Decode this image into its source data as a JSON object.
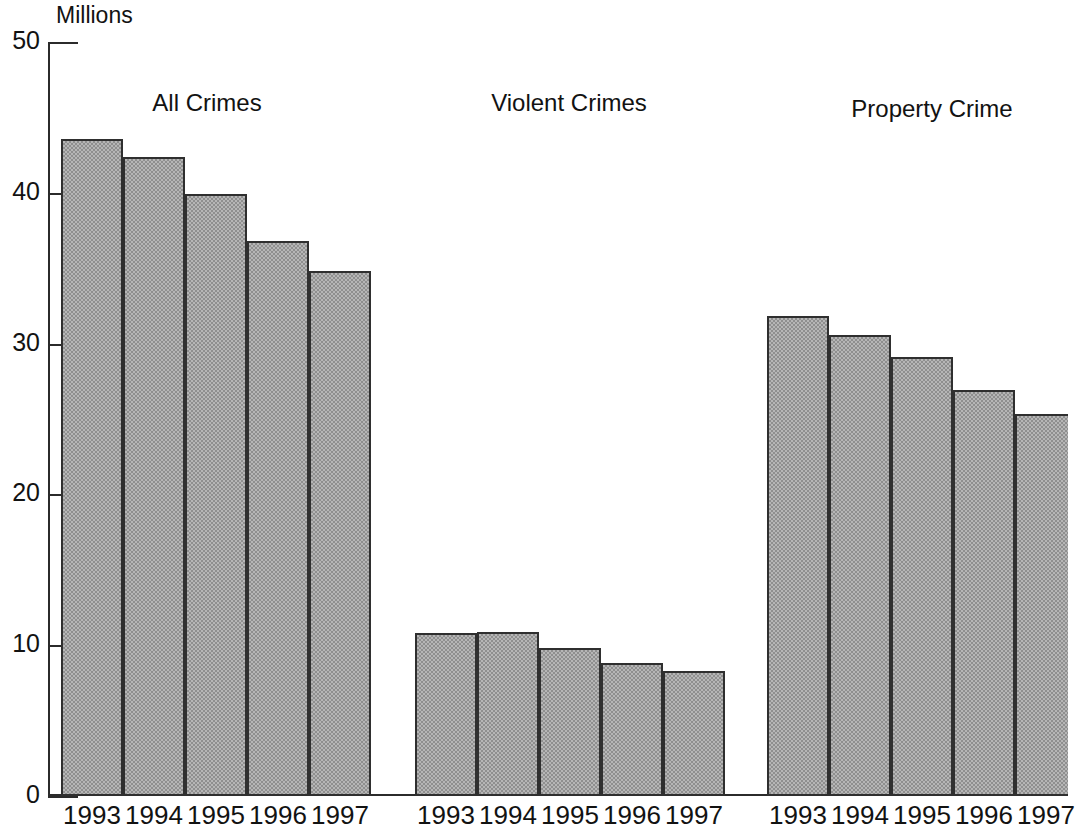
{
  "chart_data": {
    "type": "bar",
    "title": "",
    "subtitle": "",
    "unit_label": "Millions",
    "xlabel": "",
    "ylabel": "Millions",
    "ylim": [
      0,
      50
    ],
    "yticks": [
      0,
      10,
      20,
      30,
      40,
      50
    ],
    "ytick_labels": [
      "0",
      "10",
      "20",
      "30",
      "40",
      "50"
    ],
    "grid": false,
    "legend": "none",
    "categories": [
      "1993",
      "1994",
      "1995",
      "1996",
      "1997"
    ],
    "groups": [
      {
        "name": "All Crimes",
        "categories": [
          "1993",
          "1994",
          "1995",
          "1996",
          "1997"
        ],
        "values": [
          43.6,
          42.4,
          39.9,
          36.8,
          34.8
        ]
      },
      {
        "name": "Violent Crimes",
        "categories": [
          "1993",
          "1994",
          "1995",
          "1996",
          "1997"
        ],
        "values": [
          10.8,
          10.9,
          9.8,
          8.8,
          8.3
        ]
      },
      {
        "name": "Property Crime",
        "categories": [
          "1993",
          "1994",
          "1995",
          "1996",
          "1997"
        ],
        "values": [
          31.8,
          30.6,
          29.1,
          26.9,
          25.3
        ]
      }
    ],
    "colors": {
      "bar_fill": "#b6b6b6",
      "bar_fill_dither": "#8f8f8f",
      "bar_stroke": "#2f2f2f",
      "axis": "#2b2b2b",
      "text": "#121212",
      "background": "#ffffff"
    }
  },
  "axis": {
    "unit_caption": "Millions",
    "ticks": [
      {
        "label": "50"
      },
      {
        "label": "40"
      },
      {
        "label": "30"
      },
      {
        "label": "20"
      },
      {
        "label": "10"
      },
      {
        "label": "0"
      }
    ]
  },
  "groups": [
    {
      "title": "All Crimes",
      "bars": [
        {
          "year": "1993",
          "value": "43.6"
        },
        {
          "year": "1994",
          "value": "42.4"
        },
        {
          "year": "1995",
          "value": "39.9"
        },
        {
          "year": "1996",
          "value": "36.8"
        },
        {
          "year": "1997",
          "value": "34.8"
        }
      ]
    },
    {
      "title": "Violent Crimes",
      "bars": [
        {
          "year": "1993",
          "value": "10.8"
        },
        {
          "year": "1994",
          "value": "10.9"
        },
        {
          "year": "1995",
          "value": "9.8"
        },
        {
          "year": "1996",
          "value": "8.8"
        },
        {
          "year": "1997",
          "value": "8.3"
        }
      ]
    },
    {
      "title": "Property Crime",
      "bars": [
        {
          "year": "1993",
          "value": "31.8"
        },
        {
          "year": "1994",
          "value": "30.6"
        },
        {
          "year": "1995",
          "value": "29.1"
        },
        {
          "year": "1996",
          "value": "26.9"
        },
        {
          "year": "1997",
          "value": "25.3"
        }
      ]
    }
  ]
}
